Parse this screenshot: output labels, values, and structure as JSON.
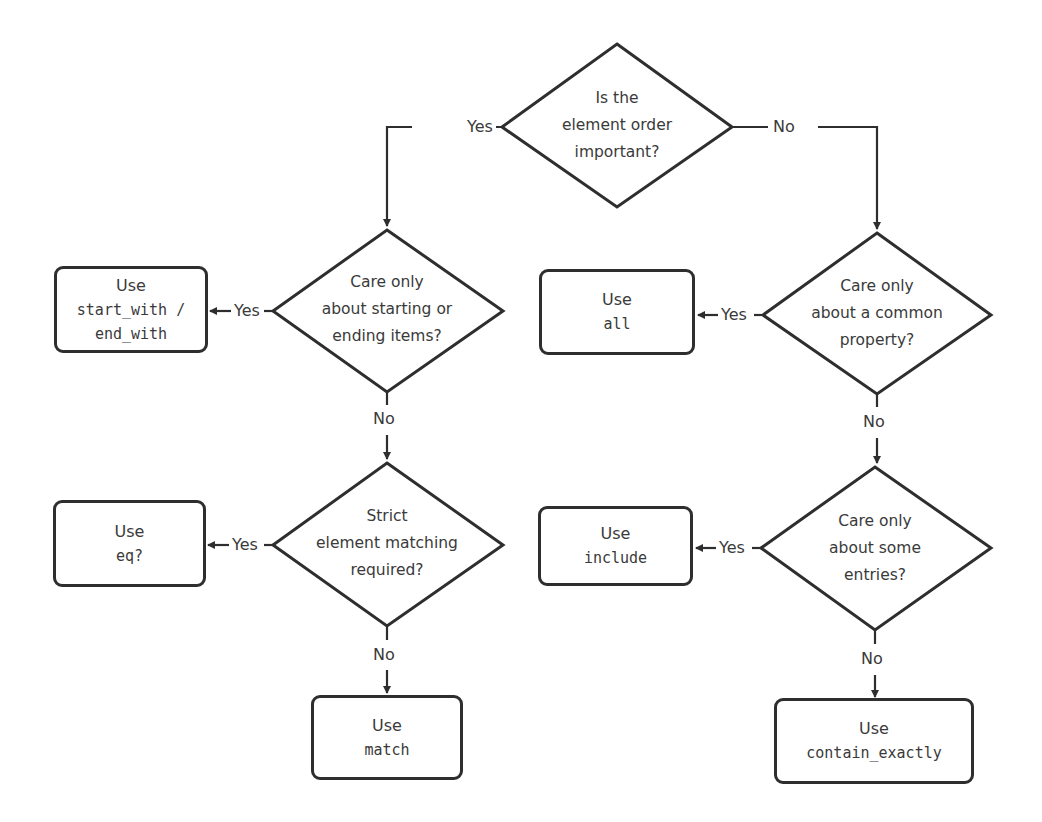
{
  "diagram": {
    "type": "flowchart",
    "colors": {
      "stroke": "#2e2e2e",
      "text": "#3a3a3a",
      "background": "#ffffff"
    },
    "nodes": {
      "q_order": {
        "shape": "diamond",
        "lines": [
          "Is the",
          "element order",
          "important?"
        ]
      },
      "q_start_end": {
        "shape": "diamond",
        "lines": [
          "Care only",
          "about starting or",
          "ending items?"
        ]
      },
      "q_common": {
        "shape": "diamond",
        "lines": [
          "Care only",
          "about a common",
          "property?"
        ]
      },
      "q_strict": {
        "shape": "diamond",
        "lines": [
          "Strict",
          "element matching",
          "required?"
        ]
      },
      "q_some": {
        "shape": "diamond",
        "lines": [
          "Care only",
          "about some",
          "entries?"
        ]
      },
      "r_start_with": {
        "shape": "box",
        "use": "Use",
        "code_lines": [
          "start_with /",
          "end_with"
        ]
      },
      "r_all": {
        "shape": "box",
        "use": "Use",
        "code_lines": [
          "all"
        ]
      },
      "r_eq": {
        "shape": "box",
        "use": "Use",
        "code_lines": [
          "eq?"
        ]
      },
      "r_include": {
        "shape": "box",
        "use": "Use",
        "code_lines": [
          "include"
        ]
      },
      "r_match": {
        "shape": "box",
        "use": "Use",
        "code_lines": [
          "match"
        ]
      },
      "r_contain_exactly": {
        "shape": "box",
        "use": "Use",
        "code_lines": [
          "contain_exactly"
        ]
      }
    },
    "edge_labels": {
      "order_yes": "Yes",
      "order_no": "No",
      "start_end_yes": "Yes",
      "start_end_no": "No",
      "common_yes": "Yes",
      "common_no": "No",
      "strict_yes": "Yes",
      "strict_no": "No",
      "some_yes": "Yes",
      "some_no": "No"
    },
    "edges": [
      {
        "from": "q_order",
        "to": "q_start_end",
        "label": "Yes"
      },
      {
        "from": "q_order",
        "to": "q_common",
        "label": "No"
      },
      {
        "from": "q_start_end",
        "to": "r_start_with",
        "label": "Yes"
      },
      {
        "from": "q_start_end",
        "to": "q_strict",
        "label": "No"
      },
      {
        "from": "q_common",
        "to": "r_all",
        "label": "Yes"
      },
      {
        "from": "q_common",
        "to": "q_some",
        "label": "No"
      },
      {
        "from": "q_strict",
        "to": "r_eq",
        "label": "Yes"
      },
      {
        "from": "q_strict",
        "to": "r_match",
        "label": "No"
      },
      {
        "from": "q_some",
        "to": "r_include",
        "label": "Yes"
      },
      {
        "from": "q_some",
        "to": "r_contain_exactly",
        "label": "No"
      }
    ]
  }
}
